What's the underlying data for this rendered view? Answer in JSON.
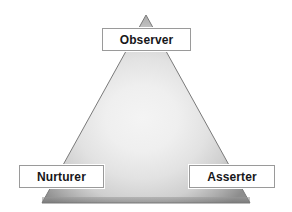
{
  "diagram": {
    "shape": "triangle",
    "background_color": "#ffffff",
    "fill": {
      "type": "radial-gradient",
      "center_color": "#f2f2f2",
      "edge_color": "#8d8d8d",
      "outline_color": "#6f6f6f"
    },
    "geometry": {
      "apex_x": 146,
      "apex_y": 15,
      "base_left_x": 42,
      "base_right_x": 250,
      "base_y": 203
    },
    "nodes": [
      {
        "id": "observer",
        "label": "Observer",
        "position": "apex",
        "box": {
          "x": 102,
          "y": 28,
          "width": 89,
          "height": 23
        }
      },
      {
        "id": "nurturer",
        "label": "Nurturer",
        "position": "bottom-left",
        "box": {
          "x": 19,
          "y": 165,
          "width": 85,
          "height": 23
        }
      },
      {
        "id": "asserter",
        "label": "Asserter",
        "position": "bottom-right",
        "box": {
          "x": 189,
          "y": 165,
          "width": 86,
          "height": 23
        }
      }
    ],
    "label_box_style": {
      "background": "#ffffff",
      "border_color": "#9a9a9a",
      "text_color": "#17171a"
    }
  }
}
